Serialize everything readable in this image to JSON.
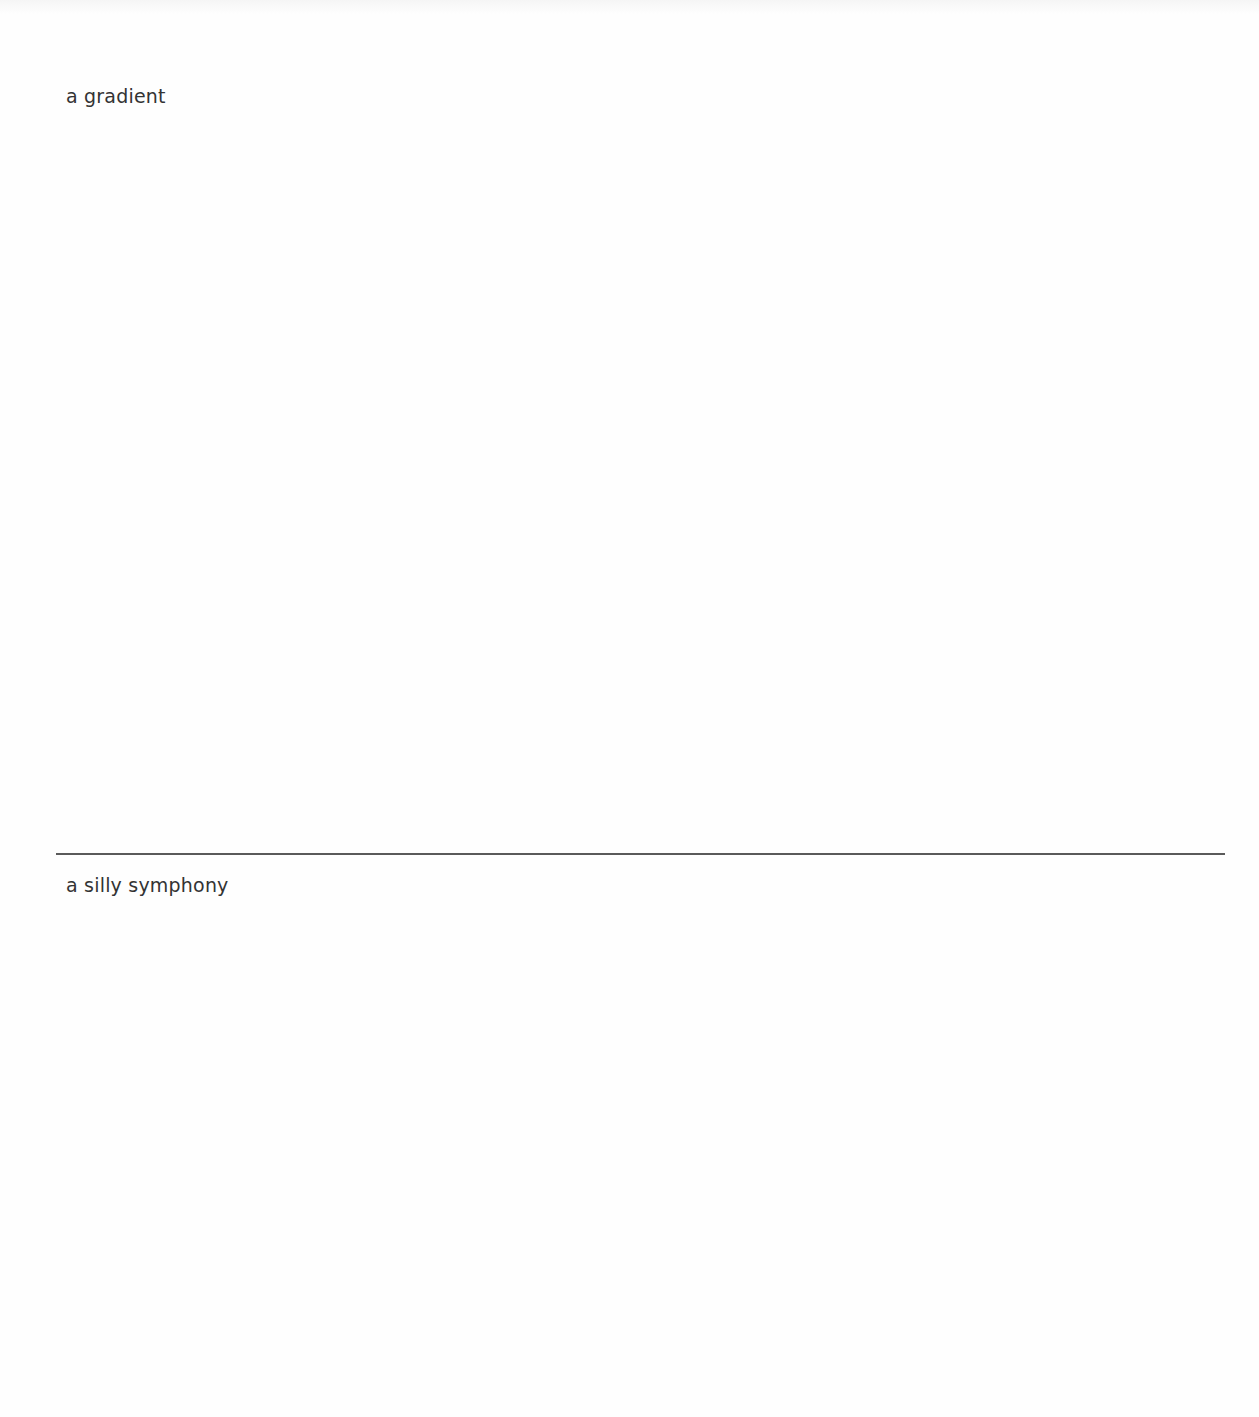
{
  "sections": [
    {
      "label": "a gradient"
    },
    {
      "label": "a silly symphony"
    }
  ],
  "colors": {
    "background": "#fefefe",
    "text": "#333333",
    "divider": "#5a5a5a"
  }
}
